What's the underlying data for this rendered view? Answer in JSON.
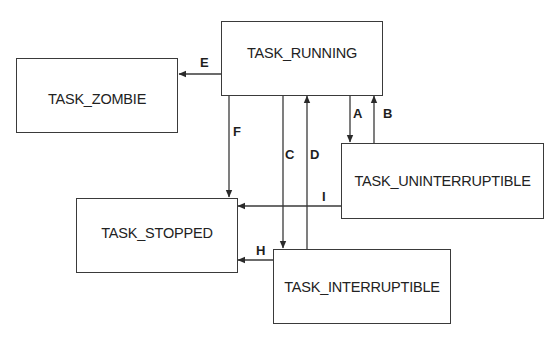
{
  "diagram": {
    "type": "state-transition",
    "states": [
      {
        "id": "running",
        "label": "TASK_RUNNING"
      },
      {
        "id": "zombie",
        "label": "TASK_ZOMBIE"
      },
      {
        "id": "uninterruptible",
        "label": "TASK_UNINTERRUPTIBLE"
      },
      {
        "id": "stopped",
        "label": "TASK_STOPPED"
      },
      {
        "id": "interruptible",
        "label": "TASK_INTERRUPTIBLE"
      }
    ],
    "transitions": [
      {
        "label": "A",
        "from": "TASK_RUNNING",
        "to": "TASK_UNINTERRUPTIBLE"
      },
      {
        "label": "B",
        "from": "TASK_UNINTERRUPTIBLE",
        "to": "TASK_RUNNING"
      },
      {
        "label": "C",
        "from": "TASK_RUNNING",
        "to": "TASK_INTERRUPTIBLE"
      },
      {
        "label": "D",
        "from": "TASK_INTERRUPTIBLE",
        "to": "TASK_RUNNING"
      },
      {
        "label": "E",
        "from": "TASK_RUNNING",
        "to": "TASK_ZOMBIE"
      },
      {
        "label": "F",
        "from": "TASK_RUNNING",
        "to": "TASK_STOPPED"
      },
      {
        "label": "H",
        "from": "TASK_INTERRUPTIBLE",
        "to": "TASK_STOPPED"
      },
      {
        "label": "I",
        "from": "TASK_UNINTERRUPTIBLE",
        "to": "TASK_STOPPED"
      }
    ]
  }
}
